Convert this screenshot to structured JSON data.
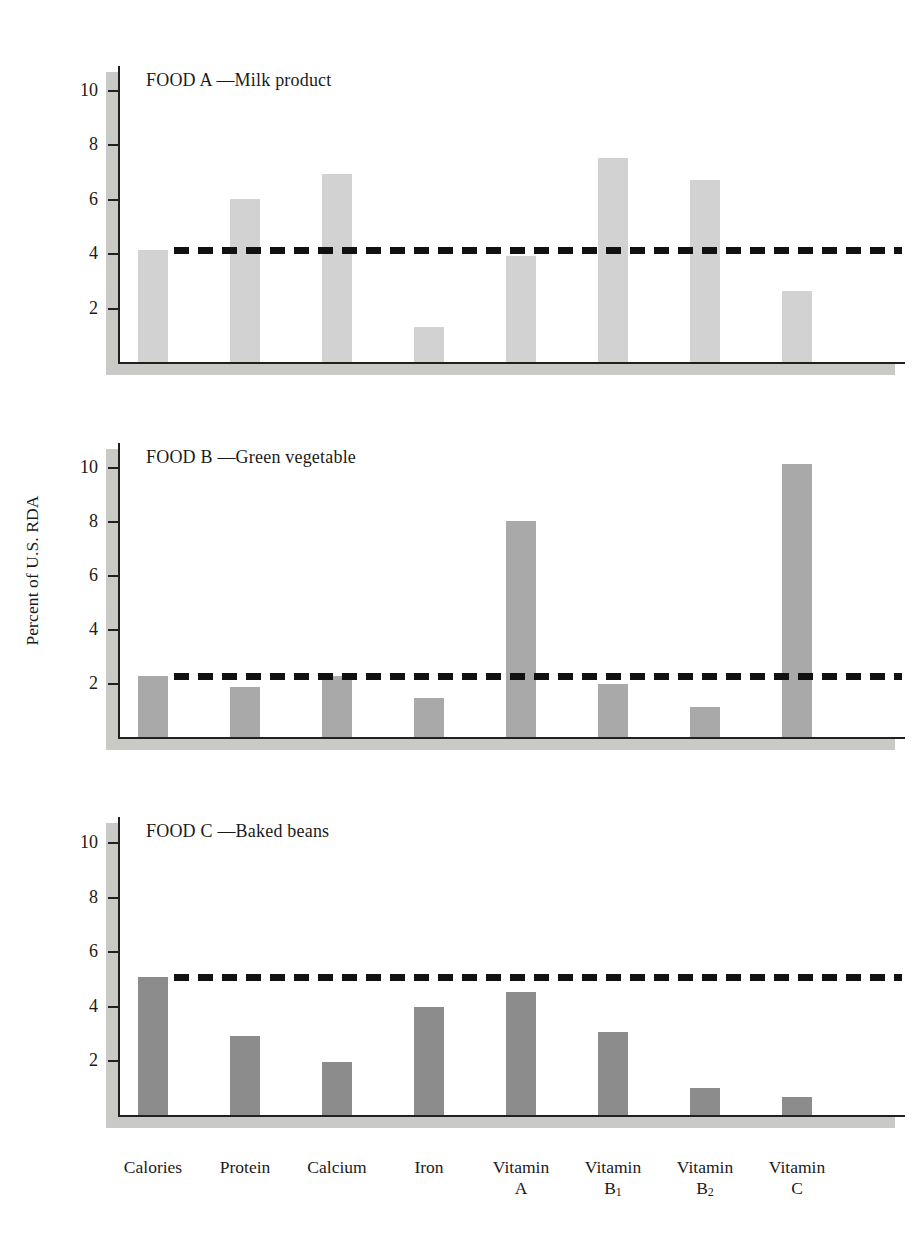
{
  "figure": {
    "ylabel": "Percent of U.S. RDA",
    "categories": [
      "Calories",
      "Protein",
      "Calcium",
      "Iron",
      "Vitamin A",
      "Vitamin B1",
      "Vitamin B2",
      "Vitamin C"
    ],
    "category_lines": [
      [
        "Calories",
        ""
      ],
      [
        "Protein",
        ""
      ],
      [
        "Calcium",
        ""
      ],
      [
        "Iron",
        ""
      ],
      [
        "Vitamin",
        "A"
      ],
      [
        "Vitamin",
        "B1"
      ],
      [
        "Vitamin",
        "B2"
      ],
      [
        "Vitamin",
        "C"
      ]
    ],
    "yticks": [
      2,
      4,
      6,
      8,
      10
    ],
    "ylim": [
      0,
      11
    ],
    "panels": [
      {
        "id": "food-a",
        "title": "FOOD A —Milk product",
        "bar_color": "#d2d2d2",
        "reference_line": 4.1,
        "values": [
          4.1,
          6.0,
          6.9,
          1.3,
          3.9,
          7.5,
          6.7,
          2.6
        ]
      },
      {
        "id": "food-b",
        "title": "FOOD B —Green vegetable",
        "bar_color": "#a9a9a9",
        "reference_line": 2.25,
        "values": [
          2.25,
          1.85,
          2.25,
          1.45,
          8.0,
          1.95,
          1.1,
          10.1
        ]
      },
      {
        "id": "food-c",
        "title": "FOOD C —Baked beans",
        "bar_color": "#8c8c8c",
        "reference_line": 5.05,
        "values": [
          5.05,
          2.9,
          1.95,
          3.95,
          4.5,
          3.05,
          1.0,
          0.65
        ]
      }
    ]
  },
  "chart_data": {
    "type": "bar",
    "title": "",
    "xlabel": "",
    "ylabel": "Percent of U.S. RDA",
    "ylim": [
      0,
      11
    ],
    "yticks": [
      2,
      4,
      6,
      8,
      10
    ],
    "grid": false,
    "legend": "none",
    "categories": [
      "Calories",
      "Protein",
      "Calcium",
      "Iron",
      "Vitamin A",
      "Vitamin B1",
      "Vitamin B2",
      "Vitamin C"
    ],
    "panels": [
      {
        "name": "FOOD A —Milk product",
        "values": [
          4.1,
          6.0,
          6.9,
          1.3,
          3.9,
          7.5,
          6.7,
          2.6
        ],
        "reference_line": 4.1,
        "bar_color": "#d2d2d2"
      },
      {
        "name": "FOOD B —Green vegetable",
        "values": [
          2.25,
          1.85,
          2.25,
          1.45,
          8.0,
          1.95,
          1.1,
          10.1
        ],
        "reference_line": 2.25,
        "bar_color": "#a9a9a9"
      },
      {
        "name": "FOOD C —Baked beans",
        "values": [
          5.05,
          2.9,
          1.95,
          3.95,
          4.5,
          3.05,
          1.0,
          0.65
        ],
        "reference_line": 5.05,
        "bar_color": "#8c8c8c"
      }
    ],
    "annotations": [
      "Dashed horizontal line in each panel marks the value of the Calories bar for that food."
    ]
  }
}
